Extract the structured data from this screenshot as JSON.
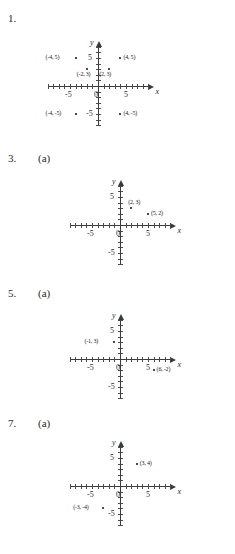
{
  "page": {
    "kind": "math-worksheet-coordinate-plane-answers",
    "background_color": "#ffffff",
    "ink_color": "#1a1a1a"
  },
  "axis_defaults": {
    "x_label": "x",
    "y_label": "y",
    "tick_labels_x": [
      "-5",
      "5"
    ],
    "tick_labels_y": [
      "5",
      "-5"
    ],
    "origin_label": "0",
    "x_range": [
      -9,
      9
    ],
    "y_range": [
      -7,
      7
    ]
  },
  "problems": [
    {
      "number": "1.",
      "part": "",
      "chart_data": {
        "type": "scatter",
        "title": "",
        "xlabel": "x",
        "ylabel": "y",
        "xlim": [
          -9,
          9
        ],
        "ylim": [
          -7,
          7
        ],
        "grid": false,
        "xticklabels": [
          "-5",
          "0",
          "5"
        ],
        "yticklabels": [
          "5",
          "-5"
        ],
        "points": [
          {
            "x": -4,
            "y": 5,
            "label": "(-4, 5)",
            "label_side": "left"
          },
          {
            "x": 4,
            "y": 5,
            "label": "(4, 5)",
            "label_side": "right"
          },
          {
            "x": -2,
            "y": 3,
            "label": "(-2, 3)",
            "label_side": "below"
          },
          {
            "x": 2,
            "y": 3,
            "label": "(2, 3)",
            "label_side": "below"
          },
          {
            "x": -4,
            "y": -5,
            "label": "(-4, -5)",
            "label_side": "left"
          },
          {
            "x": 4,
            "y": -5,
            "label": "(4, -5)",
            "label_side": "right"
          }
        ]
      }
    },
    {
      "number": "3.",
      "part": "(a)",
      "chart_data": {
        "type": "scatter",
        "title": "",
        "xlabel": "x",
        "ylabel": "y",
        "xlim": [
          -9,
          9
        ],
        "ylim": [
          -7,
          7
        ],
        "grid": false,
        "xticklabels": [
          "-5",
          "0",
          "5"
        ],
        "yticklabels": [
          "5",
          "-5"
        ],
        "points": [
          {
            "x": 2,
            "y": 3,
            "label": "(2, 3)",
            "label_side": "above"
          },
          {
            "x": 5,
            "y": 2,
            "label": "(5, 2)",
            "label_side": "right"
          }
        ]
      }
    },
    {
      "number": "5.",
      "part": "(a)",
      "chart_data": {
        "type": "scatter",
        "title": "",
        "xlabel": "x",
        "ylabel": "y",
        "xlim": [
          -9,
          9
        ],
        "ylim": [
          -7,
          7
        ],
        "grid": false,
        "xticklabels": [
          "-5",
          "0",
          "5"
        ],
        "yticklabels": [
          "5",
          "-5"
        ],
        "points": [
          {
            "x": -1,
            "y": 3,
            "label": "(-1, 3)",
            "label_side": "left"
          },
          {
            "x": 6,
            "y": -2,
            "label": "(6, -2)",
            "label_side": "right"
          }
        ]
      }
    },
    {
      "number": "7.",
      "part": "(a)",
      "chart_data": {
        "type": "scatter",
        "title": "",
        "xlabel": "x",
        "ylabel": "y",
        "xlim": [
          -9,
          9
        ],
        "ylim": [
          -7,
          7
        ],
        "grid": false,
        "xticklabels": [
          "-5",
          "0",
          "5"
        ],
        "yticklabels": [
          "5",
          "-5"
        ],
        "points": [
          {
            "x": 3,
            "y": 4,
            "label": "(3, 4)",
            "label_side": "right"
          },
          {
            "x": -3,
            "y": -4,
            "label": "(-3, -4)",
            "label_side": "left"
          }
        ]
      }
    }
  ]
}
